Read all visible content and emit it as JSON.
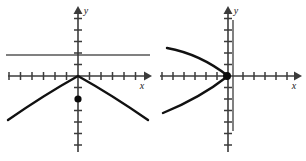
{
  "figure": {
    "background_color": "#ffffff",
    "curve_color": "#111111",
    "axis_color": "#3b3b3b",
    "directrix_color": "#565656",
    "focus_color": "#0a0a0a",
    "panels": [
      {
        "id": "left-panel",
        "name": "downward-opening-parabola",
        "origin": {
          "x": 78,
          "y": 76
        },
        "unit": 11.5,
        "axis_labels": {
          "x": "x",
          "y": "y"
        },
        "x_axis": {
          "start_x": 8,
          "end_x": 148,
          "y": 76,
          "arrow": "right"
        },
        "y_axis": {
          "x": 78,
          "start_y": 152,
          "end_y": 8,
          "arrow": "up"
        },
        "x_ticks": [
          -6,
          -5,
          -4,
          -3,
          -2,
          -1,
          1,
          2,
          3,
          4,
          5,
          6
        ],
        "y_ticks": [
          -6,
          -5,
          -4,
          -3,
          -2,
          -1,
          1,
          2,
          3,
          4,
          5
        ],
        "tick_half_length": 4,
        "curve": {
          "type": "parabola",
          "opens": "down",
          "vertex": {
            "x": 0,
            "y": 0
          },
          "path": "M 8 120 Q 44 95 78 76 Q 112 95 148 120"
        },
        "directrix": {
          "orientation": "horizontal",
          "value": 2,
          "path": "M 6 55 L 150 55"
        },
        "focus": {
          "x": 0,
          "y": -2,
          "px": 78,
          "py": 99,
          "radius": 3.6
        },
        "x_label_pos": {
          "x": 142,
          "y": 89
        },
        "y_label_pos": {
          "x": 86,
          "y": 14
        }
      },
      {
        "id": "right-panel",
        "name": "leftward-opening-parabola",
        "origin": {
          "x": 228,
          "y": 76
        },
        "unit": 11.5,
        "axis_labels": {
          "x": "x",
          "y": "y"
        },
        "x_axis": {
          "start_x": 160,
          "end_x": 300,
          "y": 76,
          "arrow": "right"
        },
        "y_axis": {
          "x": 228,
          "start_y": 152,
          "end_y": 8,
          "arrow": "up"
        },
        "x_ticks": [
          -6,
          -5,
          -4,
          -3,
          -2,
          -1,
          1,
          2,
          3,
          4,
          5,
          6
        ],
        "y_ticks": [
          -6,
          -5,
          -4,
          -3,
          -2,
          -1,
          1,
          2,
          3,
          4,
          5
        ],
        "tick_half_length": 4,
        "curve": {
          "type": "parabola",
          "opens": "left",
          "vertex": {
            "x": 0,
            "y": 0
          },
          "path": "M 167 48 Q 200 54 228 76 Q 200 98 163 113"
        },
        "directrix": {
          "orientation": "vertical",
          "value": 0.5,
          "path": "M 233 20 L 233 131"
        },
        "focus": {
          "x": 0,
          "y": 0,
          "px": 227,
          "py": 76,
          "radius": 4.0
        },
        "x_label_pos": {
          "x": 294,
          "y": 89
        },
        "y_label_pos": {
          "x": 236,
          "y": 14
        }
      }
    ]
  }
}
